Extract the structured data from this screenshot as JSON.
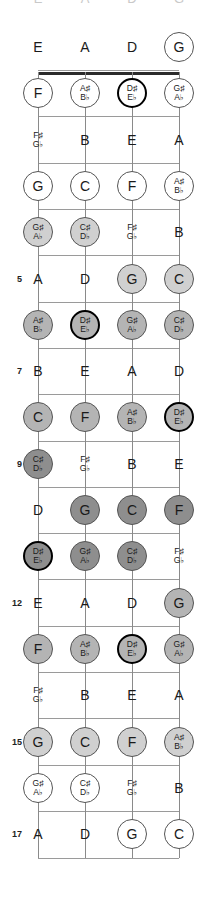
{
  "diagram": {
    "instrument": "4-string bass",
    "open_strings": [
      "E",
      "A",
      "D",
      "G"
    ],
    "fret_count": 17,
    "colors": {
      "nut": "#2b2b2b",
      "fret_wire": "#9a9a9a",
      "string": "#8a8a8a",
      "note_text": "#1a1a1a",
      "circle_border": "#555555",
      "root_border": "#000000"
    },
    "string_x": [
      38,
      85,
      132,
      179
    ],
    "fret_numbers_shown": [
      "5",
      "7",
      "9",
      "12",
      "15",
      "17"
    ],
    "top_cut_row": [
      "E",
      "A",
      "D",
      "G"
    ]
  },
  "chart_data": {
    "type": "table",
    "columns": [
      "E string",
      "A string",
      "D string",
      "G string"
    ],
    "row_labels": [
      "0",
      "1",
      "2",
      "3",
      "4",
      "5",
      "6",
      "7",
      "8",
      "9",
      "10",
      "11",
      "12",
      "13",
      "14",
      "15",
      "16",
      "17"
    ],
    "rows": [
      {
        "fret": "0",
        "number_label": "",
        "cells": [
          {
            "note": "E",
            "accidental": false,
            "style": "plain",
            "shade": "none"
          },
          {
            "note": "A",
            "accidental": false,
            "style": "plain",
            "shade": "none"
          },
          {
            "note": "D",
            "accidental": false,
            "style": "plain",
            "shade": "none"
          },
          {
            "note": "G",
            "accidental": false,
            "style": "circle",
            "shade": "white"
          }
        ]
      },
      {
        "fret": "1",
        "number_label": "",
        "cells": [
          {
            "note": "F",
            "accidental": false,
            "style": "circle",
            "shade": "white"
          },
          {
            "note": "A♯",
            "note2": "B♭",
            "accidental": true,
            "style": "circle",
            "shade": "white"
          },
          {
            "note": "D♯",
            "note2": "E♭",
            "accidental": true,
            "style": "circle-thick",
            "shade": "white"
          },
          {
            "note": "G♯",
            "note2": "A♭",
            "accidental": true,
            "style": "circle",
            "shade": "white"
          }
        ]
      },
      {
        "fret": "2",
        "number_label": "",
        "cells": [
          {
            "note": "F♯",
            "note2": "G♭",
            "accidental": true,
            "style": "plain",
            "shade": "none"
          },
          {
            "note": "B",
            "accidental": false,
            "style": "plain",
            "shade": "none"
          },
          {
            "note": "E",
            "accidental": false,
            "style": "plain",
            "shade": "none"
          },
          {
            "note": "A",
            "accidental": false,
            "style": "plain",
            "shade": "none"
          }
        ]
      },
      {
        "fret": "3",
        "number_label": "",
        "cells": [
          {
            "note": "G",
            "accidental": false,
            "style": "circle",
            "shade": "white"
          },
          {
            "note": "C",
            "accidental": false,
            "style": "circle",
            "shade": "white"
          },
          {
            "note": "F",
            "accidental": false,
            "style": "circle",
            "shade": "white"
          },
          {
            "note": "A♯",
            "note2": "B♭",
            "accidental": true,
            "style": "circle",
            "shade": "white"
          }
        ]
      },
      {
        "fret": "4",
        "number_label": "",
        "cells": [
          {
            "note": "G♯",
            "note2": "A♭",
            "accidental": true,
            "style": "circle",
            "shade": "light"
          },
          {
            "note": "C♯",
            "note2": "D♭",
            "accidental": true,
            "style": "circle",
            "shade": "light"
          },
          {
            "note": "F♯",
            "note2": "G♭",
            "accidental": true,
            "style": "plain",
            "shade": "none"
          },
          {
            "note": "B",
            "accidental": false,
            "style": "plain",
            "shade": "none"
          }
        ]
      },
      {
        "fret": "5",
        "number_label": "5",
        "cells": [
          {
            "note": "A",
            "accidental": false,
            "style": "plain",
            "shade": "none"
          },
          {
            "note": "D",
            "accidental": false,
            "style": "plain",
            "shade": "none"
          },
          {
            "note": "G",
            "accidental": false,
            "style": "circle",
            "shade": "light"
          },
          {
            "note": "C",
            "accidental": false,
            "style": "circle",
            "shade": "light"
          }
        ]
      },
      {
        "fret": "6",
        "number_label": "",
        "cells": [
          {
            "note": "A♯",
            "note2": "B♭",
            "accidental": true,
            "style": "circle",
            "shade": "mid"
          },
          {
            "note": "D♯",
            "note2": "E♭",
            "accidental": true,
            "style": "circle-thick",
            "shade": "mid"
          },
          {
            "note": "G♯",
            "note2": "A♭",
            "accidental": true,
            "style": "circle",
            "shade": "mid"
          },
          {
            "note": "C♯",
            "note2": "D♭",
            "accidental": true,
            "style": "circle",
            "shade": "mid"
          }
        ]
      },
      {
        "fret": "7",
        "number_label": "7",
        "cells": [
          {
            "note": "B",
            "accidental": false,
            "style": "plain",
            "shade": "none"
          },
          {
            "note": "E",
            "accidental": false,
            "style": "plain",
            "shade": "none"
          },
          {
            "note": "A",
            "accidental": false,
            "style": "plain",
            "shade": "none"
          },
          {
            "note": "D",
            "accidental": false,
            "style": "plain",
            "shade": "none"
          }
        ]
      },
      {
        "fret": "8",
        "number_label": "",
        "cells": [
          {
            "note": "C",
            "accidental": false,
            "style": "circle",
            "shade": "mid"
          },
          {
            "note": "F",
            "accidental": false,
            "style": "circle",
            "shade": "mid"
          },
          {
            "note": "A♯",
            "note2": "B♭",
            "accidental": true,
            "style": "circle",
            "shade": "mid"
          },
          {
            "note": "D♯",
            "note2": "E♭",
            "accidental": true,
            "style": "circle-thick",
            "shade": "mid"
          }
        ]
      },
      {
        "fret": "9",
        "number_label": "9",
        "cells": [
          {
            "note": "C♯",
            "note2": "D♭",
            "accidental": true,
            "style": "circle",
            "shade": "dark"
          },
          {
            "note": "F♯",
            "note2": "G♭",
            "accidental": true,
            "style": "plain",
            "shade": "none"
          },
          {
            "note": "B",
            "accidental": false,
            "style": "plain",
            "shade": "none"
          },
          {
            "note": "E",
            "accidental": false,
            "style": "plain",
            "shade": "none"
          }
        ]
      },
      {
        "fret": "10",
        "number_label": "",
        "cells": [
          {
            "note": "D",
            "accidental": false,
            "style": "plain",
            "shade": "none"
          },
          {
            "note": "G",
            "accidental": false,
            "style": "circle",
            "shade": "dark"
          },
          {
            "note": "C",
            "accidental": false,
            "style": "circle",
            "shade": "dark"
          },
          {
            "note": "F",
            "accidental": false,
            "style": "circle",
            "shade": "dark"
          }
        ]
      },
      {
        "fret": "11",
        "number_label": "",
        "cells": [
          {
            "note": "D♯",
            "note2": "E♭",
            "accidental": true,
            "style": "circle-thick",
            "shade": "dark"
          },
          {
            "note": "G♯",
            "note2": "A♭",
            "accidental": true,
            "style": "circle",
            "shade": "dark"
          },
          {
            "note": "C♯",
            "note2": "D♭",
            "accidental": true,
            "style": "circle",
            "shade": "dark"
          },
          {
            "note": "F♯",
            "note2": "G♭",
            "accidental": true,
            "style": "plain",
            "shade": "none"
          }
        ]
      },
      {
        "fret": "12",
        "number_label": "12",
        "cells": [
          {
            "note": "E",
            "accidental": false,
            "style": "plain",
            "shade": "none"
          },
          {
            "note": "A",
            "accidental": false,
            "style": "plain",
            "shade": "none"
          },
          {
            "note": "D",
            "accidental": false,
            "style": "plain",
            "shade": "none"
          },
          {
            "note": "G",
            "accidental": false,
            "style": "circle",
            "shade": "mid"
          }
        ]
      },
      {
        "fret": "13",
        "number_label": "",
        "cells": [
          {
            "note": "F",
            "accidental": false,
            "style": "circle",
            "shade": "mid"
          },
          {
            "note": "A♯",
            "note2": "B♭",
            "accidental": true,
            "style": "circle",
            "shade": "mid"
          },
          {
            "note": "D♯",
            "note2": "E♭",
            "accidental": true,
            "style": "circle-thick",
            "shade": "mid"
          },
          {
            "note": "G♯",
            "note2": "A♭",
            "accidental": true,
            "style": "circle",
            "shade": "mid"
          }
        ]
      },
      {
        "fret": "14",
        "number_label": "",
        "cells": [
          {
            "note": "F♯",
            "note2": "G♭",
            "accidental": true,
            "style": "plain",
            "shade": "none"
          },
          {
            "note": "B",
            "accidental": false,
            "style": "plain",
            "shade": "none"
          },
          {
            "note": "E",
            "accidental": false,
            "style": "plain",
            "shade": "none"
          },
          {
            "note": "A",
            "accidental": false,
            "style": "plain",
            "shade": "none"
          }
        ]
      },
      {
        "fret": "15",
        "number_label": "15",
        "cells": [
          {
            "note": "G",
            "accidental": false,
            "style": "circle",
            "shade": "light"
          },
          {
            "note": "C",
            "accidental": false,
            "style": "circle",
            "shade": "light"
          },
          {
            "note": "F",
            "accidental": false,
            "style": "circle",
            "shade": "light"
          },
          {
            "note": "A♯",
            "note2": "B♭",
            "accidental": true,
            "style": "circle",
            "shade": "light"
          }
        ]
      },
      {
        "fret": "16",
        "number_label": "",
        "cells": [
          {
            "note": "G♯",
            "note2": "A♭",
            "accidental": true,
            "style": "circle",
            "shade": "white"
          },
          {
            "note": "C♯",
            "note2": "D♭",
            "accidental": true,
            "style": "circle",
            "shade": "white"
          },
          {
            "note": "F♯",
            "note2": "G♭",
            "accidental": true,
            "style": "plain",
            "shade": "none"
          },
          {
            "note": "B",
            "accidental": false,
            "style": "plain",
            "shade": "none"
          }
        ]
      },
      {
        "fret": "17",
        "number_label": "17",
        "cells": [
          {
            "note": "A",
            "accidental": false,
            "style": "plain",
            "shade": "none"
          },
          {
            "note": "D",
            "accidental": false,
            "style": "plain",
            "shade": "none"
          },
          {
            "note": "G",
            "accidental": false,
            "style": "circle",
            "shade": "white"
          },
          {
            "note": "C",
            "accidental": false,
            "style": "circle",
            "shade": "white"
          }
        ]
      }
    ],
    "shade_colors": {
      "none": "transparent",
      "white": "#ffffff",
      "light": "#d0d0d0",
      "mid": "#b4b4b4",
      "dark": "#8e8e8e"
    }
  }
}
